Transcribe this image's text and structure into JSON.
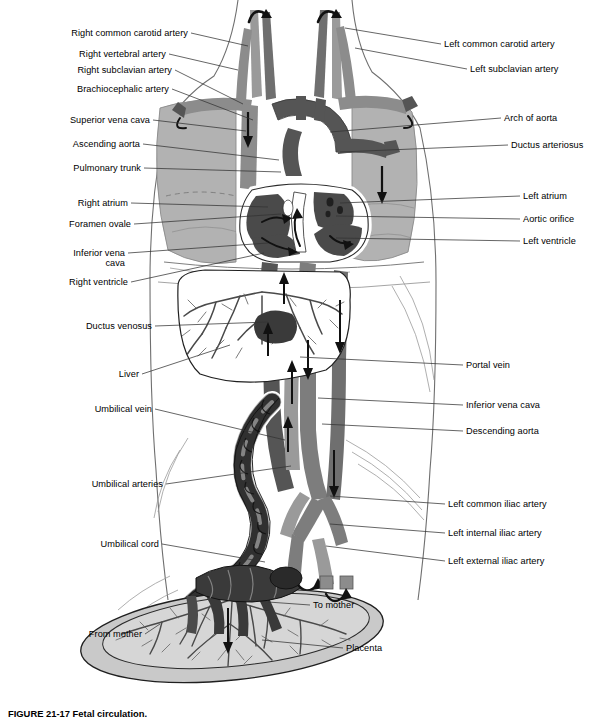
{
  "figure": {
    "title": "Fetal Circulation",
    "caption": "FIGURE 21-17 Fetal circulation.",
    "type": "anatomical-illustration",
    "palette": {
      "background": "#ffffff",
      "outline": "#000000",
      "lung_fill": "#b2b2b2",
      "vessel_light": "#9a9a9a",
      "vessel_mid": "#7d7d7d",
      "vessel_dark": "#555555",
      "chamber_dark": "#4a4a4a",
      "cord_dark": "#3a3a3a",
      "placenta_fill": "#c9c9c9",
      "leader_line": "#333333",
      "body_outline": "#6a6a6a"
    }
  },
  "labels_left": [
    {
      "text": "Right common carotid artery",
      "x": 188,
      "y": 33,
      "tx": 248,
      "ty": 46
    },
    {
      "text": "Right vertebral artery",
      "x": 166,
      "y": 54,
      "tx": 238,
      "ty": 70
    },
    {
      "text": "Right subclavian artery",
      "x": 172,
      "y": 70,
      "tx": 243,
      "ty": 104
    },
    {
      "text": "Brachiocephalic artery",
      "x": 169,
      "y": 89,
      "tx": 253,
      "ty": 120
    },
    {
      "text": "Superior vena cava",
      "x": 150,
      "y": 120,
      "tx": 246,
      "ty": 131
    },
    {
      "text": "Ascending aorta",
      "x": 140,
      "y": 144,
      "tx": 279,
      "ty": 160
    },
    {
      "text": "Pulmonary trunk",
      "x": 141,
      "y": 168,
      "tx": 281,
      "ty": 172
    },
    {
      "text": "Right atrium",
      "x": 128,
      "y": 203,
      "tx": 268,
      "ty": 207
    },
    {
      "text": "Foramen ovale",
      "x": 131,
      "y": 224,
      "tx": 281,
      "ty": 214
    },
    {
      "text": "Inferior vena",
      "x": 125,
      "y": 253,
      "tx": 268,
      "ty": 243
    },
    {
      "text": "cava",
      "x": 125,
      "y": 263,
      "tx": 0,
      "ty": 0
    },
    {
      "text": "Right ventricle",
      "x": 128,
      "y": 282,
      "tx": 264,
      "ty": 253
    },
    {
      "text": "Ductus venosus",
      "x": 152,
      "y": 326,
      "tx": 268,
      "ty": 322
    },
    {
      "text": "Liver",
      "x": 139,
      "y": 374,
      "tx": 230,
      "ty": 345
    },
    {
      "text": "Umbilical vein",
      "x": 152,
      "y": 409,
      "tx": 285,
      "ty": 440
    },
    {
      "text": "Umbilical arteries",
      "x": 163,
      "y": 484,
      "tx": 291,
      "ty": 466
    },
    {
      "text": "Umbilical cord",
      "x": 159,
      "y": 544,
      "tx": 265,
      "ty": 562
    },
    {
      "text": "From mother",
      "x": 142,
      "y": 634,
      "tx": 160,
      "ty": 624
    }
  ],
  "labels_right": [
    {
      "text": "Left common carotid artery",
      "x": 444,
      "y": 44,
      "tx": 345,
      "ty": 28
    },
    {
      "text": "Left subclavian artery",
      "x": 470,
      "y": 69,
      "tx": 355,
      "ty": 48
    },
    {
      "text": "Arch of aorta",
      "x": 504,
      "y": 118,
      "tx": 330,
      "ty": 132
    },
    {
      "text": "Ductus arteriosus",
      "x": 511,
      "y": 145,
      "tx": 340,
      "ty": 152
    },
    {
      "text": "Left atrium",
      "x": 523,
      "y": 196,
      "tx": 340,
      "ty": 203
    },
    {
      "text": "Aortic orifice",
      "x": 523,
      "y": 219,
      "tx": 336,
      "ty": 216
    },
    {
      "text": "Left ventricle",
      "x": 523,
      "y": 241,
      "tx": 336,
      "ty": 238
    },
    {
      "text": "Portal vein",
      "x": 466,
      "y": 365,
      "tx": 300,
      "ty": 357
    },
    {
      "text": "Inferior vena cava",
      "x": 466,
      "y": 405,
      "tx": 318,
      "ty": 398
    },
    {
      "text": "Descending aorta",
      "x": 466,
      "y": 431,
      "tx": 322,
      "ty": 424
    },
    {
      "text": "Left common iliac artery",
      "x": 448,
      "y": 504,
      "tx": 330,
      "ty": 496
    },
    {
      "text": "Left internal iliac artery",
      "x": 448,
      "y": 533,
      "tx": 330,
      "ty": 524
    },
    {
      "text": "Left external iliac artery",
      "x": 448,
      "y": 561,
      "tx": 326,
      "ty": 546
    },
    {
      "text": "To mother",
      "x": 313,
      "y": 605,
      "tx": 268,
      "ty": 602
    },
    {
      "text": "Placenta",
      "x": 346,
      "y": 648,
      "tx": 262,
      "ty": 640
    }
  ],
  "structures": [
    {
      "name": "lung-right",
      "kind": "organ"
    },
    {
      "name": "lung-left",
      "kind": "organ"
    },
    {
      "name": "heart",
      "kind": "organ"
    },
    {
      "name": "liver",
      "kind": "organ"
    },
    {
      "name": "placenta",
      "kind": "organ"
    },
    {
      "name": "umbilical-cord",
      "kind": "vessel"
    },
    {
      "name": "aorta",
      "kind": "vessel"
    },
    {
      "name": "inferior-vena-cava",
      "kind": "vessel"
    },
    {
      "name": "body-outline",
      "kind": "contour"
    }
  ]
}
